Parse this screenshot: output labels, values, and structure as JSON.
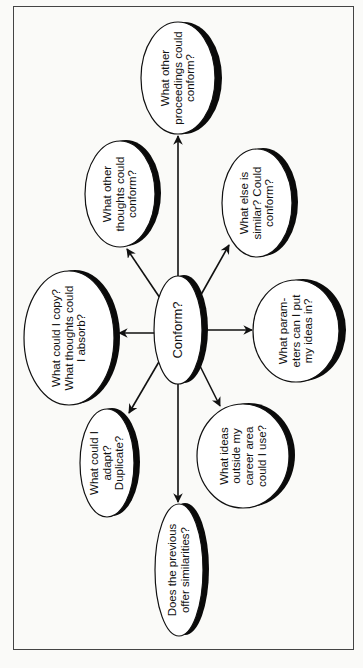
{
  "diagram": {
    "type": "mind-map",
    "orientation": "rotated -90deg",
    "colors": {
      "stroke": "#111111",
      "shadow": "#0a0a0a",
      "fill": "#ffffff",
      "frame": "#444444"
    },
    "center": {
      "label": "Conform?"
    },
    "nodes": [
      {
        "id": "proceedings",
        "label": "What other proceedings could conform?"
      },
      {
        "id": "thoughts",
        "label": "What other thoughts could conform?"
      },
      {
        "id": "similar",
        "label": "What else is similar? Could conform?"
      },
      {
        "id": "copy",
        "label": "What could I copy? What thoughts could I absorb?"
      },
      {
        "id": "parameters",
        "label": "What param- eters can I put my ideas in?"
      },
      {
        "id": "adapt",
        "label": "What could I adapt? Duplicate?"
      },
      {
        "id": "outside",
        "label": "What ideas outside my career area could I use?"
      },
      {
        "id": "previous",
        "label": "Does the previous offer similarities?"
      }
    ],
    "edges": [
      {
        "from": "center",
        "to": "proceedings"
      },
      {
        "from": "center",
        "to": "thoughts"
      },
      {
        "from": "center",
        "to": "similar"
      },
      {
        "from": "center",
        "to": "copy"
      },
      {
        "from": "center",
        "to": "parameters"
      },
      {
        "from": "center",
        "to": "adapt"
      },
      {
        "from": "center",
        "to": "outside"
      },
      {
        "from": "center",
        "to": "previous"
      }
    ]
  }
}
